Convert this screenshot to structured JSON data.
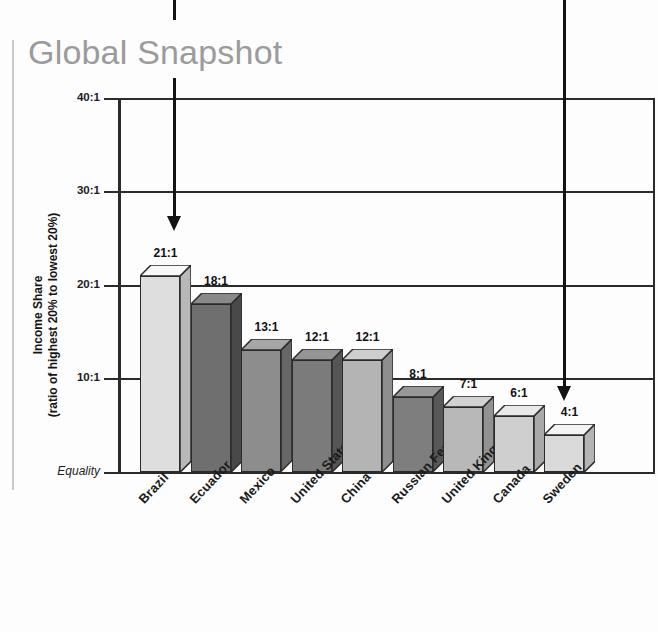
{
  "title": "Global Snapshot",
  "axis": {
    "y_caption_line1": "Income Share",
    "y_caption_line2": "(ratio of highest 20% to lowest 20%)",
    "y_ticks": [
      "40:1",
      "30:1",
      "20:1",
      "10:1",
      "Equality"
    ]
  },
  "chart_data": {
    "type": "bar",
    "title": "Global Snapshot",
    "xlabel": "",
    "ylabel": "Income Share (ratio of highest 20% to lowest 20%)",
    "ylim": [
      0,
      40
    ],
    "y_tick_values": [
      40,
      30,
      20,
      10,
      0
    ],
    "y_tick_labels": [
      "40:1",
      "30:1",
      "20:1",
      "10:1",
      "Equality"
    ],
    "grid": true,
    "legend": "none",
    "categories": [
      "Brazil",
      "Ecuador",
      "Mexico",
      "United States",
      "China",
      "Russian Federation",
      "United Kingdom",
      "Canada",
      "Sweden"
    ],
    "values": [
      21,
      18,
      13,
      12,
      12,
      8,
      7,
      6,
      4
    ],
    "value_labels": [
      "21:1",
      "18:1",
      "13:1",
      "12:1",
      "12:1",
      "8:1",
      "7:1",
      "6:1",
      "4:1"
    ],
    "bar_colors": [
      "#dedede",
      "#6f6f6f",
      "#8d8d8d",
      "#7b7b7b",
      "#b4b4b4",
      "#7e7e7e",
      "#b8b8b8",
      "#cfcfcf",
      "#dadada"
    ]
  },
  "annotations": [
    {
      "name": "arrow-brazil",
      "target": "Brazil"
    },
    {
      "name": "arrow-sweden",
      "target": "Sweden"
    }
  ]
}
